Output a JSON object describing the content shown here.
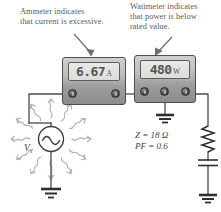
{
  "figure": {
    "type": "circuit-diagram"
  },
  "annotations": [
    {
      "id": "ammeter-note",
      "text": "Ammeter indicates\nthat current is excessive.",
      "points_to": "ammeter"
    },
    {
      "id": "wattmeter-note",
      "text": "Wattmeter indicates\nthat power is below\nrated value.",
      "points_to": "wattmeter"
    }
  ],
  "instruments": {
    "ammeter": {
      "name": "Ammeter",
      "reading": "6.67",
      "unit": "A",
      "terminals": 2
    },
    "wattmeter": {
      "name": "Wattmeter",
      "reading": "480",
      "unit": "W",
      "terminals": 3
    }
  },
  "source": {
    "name": "AC voltage source",
    "label": "V",
    "label_subscript": "s",
    "symbol": "sine-wave"
  },
  "load": {
    "impedance_label": "Z = 18 Ω",
    "impedance_symbol": "Z",
    "impedance_value": "18 Ω",
    "power_factor_label": "PF = 0.6",
    "power_factor_symbol": "PF",
    "power_factor_value": "0.6",
    "elements": [
      "resistor",
      "capacitor"
    ]
  },
  "grounds": [
    {
      "id": "source-ground"
    },
    {
      "id": "wattmeter-ground"
    },
    {
      "id": "load-ground"
    }
  ],
  "colors": {
    "wire": "#4a4a4a",
    "text": "#5b5b5b",
    "meter_body_light": "#cfcfcf",
    "meter_body_dark": "#8c8c8c",
    "lcd": "#e4e4e0",
    "radiation": "#b5b5b5"
  }
}
